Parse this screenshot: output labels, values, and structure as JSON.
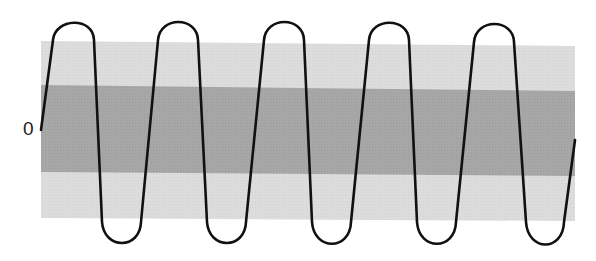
{
  "diagram": {
    "title": "",
    "labels": {
      "zero": "0"
    },
    "bands": {
      "outer": {
        "name": "outer-band",
        "color": "#dcdcdc",
        "points": "41,41 575,46 575,221 41,218"
      },
      "inner": {
        "name": "inner-band",
        "color": "#a6a6a6",
        "points": "41,85 575,91 575,176 41,172"
      }
    },
    "wave": {
      "stroke": "#111111",
      "stroke_width": 2.6,
      "path": "M 41 130 L 53 40 C 55 18, 93 16, 94 40 L 102 222 C 104 250, 140 250, 141 222 L 158 40 C 160 16, 197 16, 198 40 L 207 222 C 209 250, 245 250, 246 222 L 264 40 C 266 16, 303 16, 304 40 L 312 222 C 314 251, 350 251, 351 222 L 369 40 C 371 17, 408 17, 409 40 L 417 222 C 419 251, 455 251, 456 222 L 474 42 C 476 18, 513 18, 514 42 L 526 222 C 528 252, 563 252, 564 222 L 575 140"
    }
  }
}
